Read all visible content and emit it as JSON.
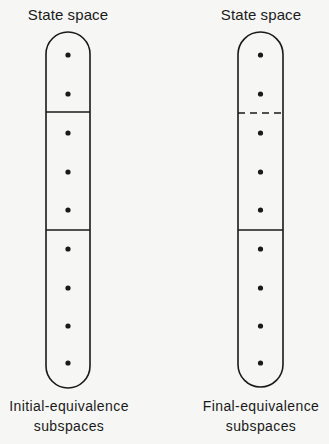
{
  "figure": {
    "left": {
      "title": "State space",
      "caption_line1": "Initial-equivalence",
      "caption_line2": "subspaces",
      "capsule": {
        "x": 46,
        "width": 44,
        "top": 32,
        "bottom": 388
      },
      "dots_y": [
        55,
        94,
        133,
        172,
        210,
        249,
        288,
        326,
        363
      ],
      "dividers": [
        {
          "y": 112,
          "style": "solid"
        },
        {
          "y": 230,
          "style": "solid"
        }
      ]
    },
    "right": {
      "title": "State space",
      "caption_line1": "Final-equivalence",
      "caption_line2": "subspaces",
      "capsule": {
        "x": 238,
        "width": 45,
        "top": 32,
        "bottom": 387
      },
      "dots_y": [
        55,
        94,
        133,
        172,
        210,
        249,
        288,
        326,
        363
      ],
      "dividers": [
        {
          "y": 113,
          "style": "dashed"
        },
        {
          "y": 230,
          "style": "solid"
        }
      ]
    },
    "stroke_color": "#1a1a1a",
    "background_color": "#f6f6f4"
  }
}
